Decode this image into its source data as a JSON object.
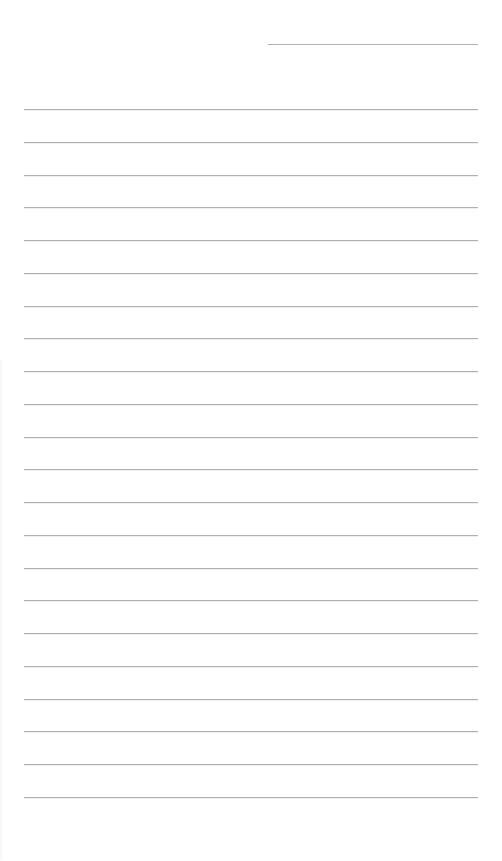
{
  "document": {
    "type": "lined-paper",
    "header_line": {
      "x": 268,
      "y": 44,
      "width": 210
    },
    "rules": {
      "count": 22,
      "first_y": 109,
      "spacing": 32.76,
      "x": 24,
      "width": 454
    },
    "line_color": "#b0b0b0",
    "background": "#ffffff"
  }
}
